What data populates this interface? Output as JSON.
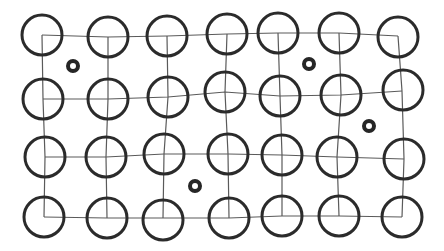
{
  "diagram": {
    "type": "lattice-grid",
    "rows": 4,
    "cols": 7,
    "background": "#ffffff",
    "colors": {
      "circle_stroke": "#2b2b2b",
      "line_stroke": "#5a5a5a",
      "ring_stroke": "#262626"
    },
    "circle_radius": 20,
    "vertices": [
      [
        [
          42,
          35
        ],
        [
          108,
          37
        ],
        [
          167,
          36
        ],
        [
          227,
          34
        ],
        [
          278,
          33
        ],
        [
          339,
          33
        ],
        [
          398,
          36
        ]
      ],
      [
        [
          43,
          99
        ],
        [
          108,
          99
        ],
        [
          168,
          97
        ],
        [
          225,
          92
        ],
        [
          280,
          96
        ],
        [
          341,
          95
        ],
        [
          402,
          91
        ]
      ],
      [
        [
          45,
          157
        ],
        [
          106,
          157
        ],
        [
          164,
          154
        ],
        [
          228,
          154
        ],
        [
          282,
          155
        ],
        [
          337,
          157
        ],
        [
          404,
          159
        ]
      ],
      [
        [
          44,
          217
        ],
        [
          107,
          218
        ],
        [
          163,
          218
        ],
        [
          229,
          218
        ],
        [
          282,
          216
        ],
        [
          339,
          216
        ],
        [
          402,
          217
        ]
      ]
    ],
    "circle_offsets": [
      [
        [
          0,
          0
        ],
        [
          0,
          0
        ],
        [
          0,
          0
        ],
        [
          0,
          0
        ],
        [
          0,
          0
        ],
        [
          0,
          0
        ],
        [
          0,
          1
        ]
      ],
      [
        [
          0,
          0
        ],
        [
          0,
          0
        ],
        [
          0,
          0
        ],
        [
          0,
          0
        ],
        [
          0,
          0
        ],
        [
          0,
          0
        ],
        [
          1,
          -1
        ]
      ],
      [
        [
          0,
          0
        ],
        [
          0,
          0
        ],
        [
          0,
          0
        ],
        [
          0,
          0
        ],
        [
          0,
          0
        ],
        [
          0,
          0
        ],
        [
          0,
          0
        ]
      ],
      [
        [
          0,
          0
        ],
        [
          0,
          0
        ],
        [
          0,
          2
        ],
        [
          0,
          0
        ],
        [
          0,
          0
        ],
        [
          0,
          0
        ],
        [
          0,
          0
        ]
      ]
    ],
    "small_rings": [
      {
        "cx": 73,
        "cy": 66,
        "r": 5
      },
      {
        "cx": 309,
        "cy": 64,
        "r": 5
      },
      {
        "cx": 369,
        "cy": 126,
        "r": 5
      },
      {
        "cx": 195,
        "cy": 186,
        "r": 5
      }
    ]
  }
}
